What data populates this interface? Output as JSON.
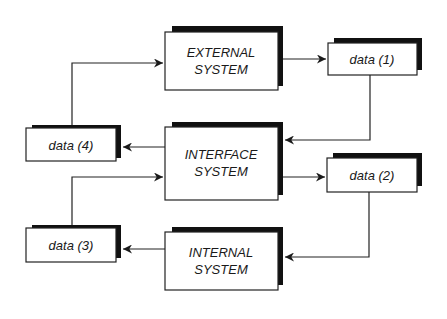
{
  "diagram": {
    "nodes": [
      {
        "id": "external",
        "lines": [
          "EXTERNAL",
          "SYSTEM"
        ]
      },
      {
        "id": "interface",
        "lines": [
          "INTERFACE",
          "SYSTEM"
        ]
      },
      {
        "id": "internal",
        "lines": [
          "INTERNAL",
          "SYSTEM"
        ]
      },
      {
        "id": "data1",
        "lines": [
          "data (1)"
        ]
      },
      {
        "id": "data2",
        "lines": [
          "data (2)"
        ]
      },
      {
        "id": "data3",
        "lines": [
          "data (3)"
        ]
      },
      {
        "id": "data4",
        "lines": [
          "data (4)"
        ]
      }
    ],
    "edges": [
      {
        "from": "external",
        "to": "data1"
      },
      {
        "from": "data1",
        "to": "interface"
      },
      {
        "from": "interface",
        "to": "data4"
      },
      {
        "from": "data4",
        "to": "external"
      },
      {
        "from": "interface",
        "to": "data2"
      },
      {
        "from": "data2",
        "to": "internal"
      },
      {
        "from": "internal",
        "to": "data3"
      },
      {
        "from": "data3",
        "to": "interface"
      }
    ]
  }
}
